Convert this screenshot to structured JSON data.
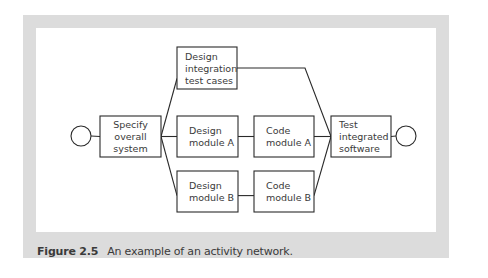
{
  "figure": {
    "label": "Figure 2.5",
    "caption": "An example of an activity network."
  },
  "nodes": [
    {
      "id": "start",
      "type": "circle",
      "name": "start-event"
    },
    {
      "id": "specify",
      "type": "activity",
      "lines": [
        "Specify",
        "overall",
        "system"
      ]
    },
    {
      "id": "design-int",
      "type": "activity",
      "lines": [
        "Design",
        "integration",
        "test cases"
      ]
    },
    {
      "id": "design-a",
      "type": "activity",
      "lines": [
        "Design",
        "module A"
      ]
    },
    {
      "id": "design-b",
      "type": "activity",
      "lines": [
        "Design",
        "module B"
      ]
    },
    {
      "id": "code-a",
      "type": "activity",
      "lines": [
        "Code",
        "module A"
      ]
    },
    {
      "id": "code-b",
      "type": "activity",
      "lines": [
        "Code",
        "module B"
      ]
    },
    {
      "id": "test",
      "type": "activity",
      "lines": [
        "Test",
        "integrated",
        "software"
      ]
    },
    {
      "id": "end",
      "type": "circle",
      "name": "end-event"
    }
  ],
  "edges": [
    [
      "start",
      "specify"
    ],
    [
      "specify",
      "design-int"
    ],
    [
      "specify",
      "design-a"
    ],
    [
      "specify",
      "design-b"
    ],
    [
      "design-a",
      "code-a"
    ],
    [
      "design-b",
      "code-b"
    ],
    [
      "design-int",
      "test"
    ],
    [
      "code-a",
      "test"
    ],
    [
      "code-b",
      "test"
    ],
    [
      "test",
      "end"
    ]
  ],
  "colors": {
    "panel": "#dcdcdc",
    "stroke": "#2a2a2a",
    "text": "#3a3a3a"
  }
}
